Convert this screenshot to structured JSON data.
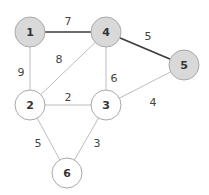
{
  "colors": {
    "highlight_fill": "#d9d9d9",
    "normal_fill": "#ffffff",
    "node_stroke": "#a8a8a8",
    "edge_normal": "#b5b5b5",
    "edge_highlight": "#3a3a3a"
  },
  "nodes": [
    {
      "id": "1",
      "label": "1",
      "x": 30,
      "y": 32,
      "highlighted": true
    },
    {
      "id": "4",
      "label": "4",
      "x": 106,
      "y": 32,
      "highlighted": true
    },
    {
      "id": "5",
      "label": "5",
      "x": 184,
      "y": 65,
      "highlighted": true
    },
    {
      "id": "2",
      "label": "2",
      "x": 30,
      "y": 105,
      "highlighted": false
    },
    {
      "id": "3",
      "label": "3",
      "x": 106,
      "y": 105,
      "highlighted": false
    },
    {
      "id": "6",
      "label": "6",
      "x": 67,
      "y": 173,
      "highlighted": false
    }
  ],
  "edges": [
    {
      "from": "1",
      "to": "4",
      "weight": "7",
      "highlighted": true,
      "lx": 68,
      "ly": 22
    },
    {
      "from": "4",
      "to": "5",
      "weight": "5",
      "highlighted": true,
      "lx": 148,
      "ly": 37
    },
    {
      "from": "1",
      "to": "2",
      "weight": "9",
      "highlighted": false,
      "lx": 21,
      "ly": 73
    },
    {
      "from": "2",
      "to": "4",
      "weight": "8",
      "highlighted": false,
      "lx": 59,
      "ly": 60
    },
    {
      "from": "4",
      "to": "3",
      "weight": "6",
      "highlighted": false,
      "lx": 114,
      "ly": 79
    },
    {
      "from": "2",
      "to": "3",
      "weight": "2",
      "highlighted": false,
      "lx": 68,
      "ly": 98
    },
    {
      "from": "3",
      "to": "5",
      "weight": "4",
      "highlighted": false,
      "lx": 153,
      "ly": 103
    },
    {
      "from": "2",
      "to": "6",
      "weight": "5",
      "highlighted": false,
      "lx": 38,
      "ly": 144
    },
    {
      "from": "3",
      "to": "6",
      "weight": "3",
      "highlighted": false,
      "lx": 97,
      "ly": 144
    }
  ],
  "node_radius": 15
}
